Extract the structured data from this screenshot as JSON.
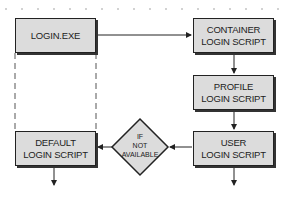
{
  "diagram": {
    "nodes": {
      "login_exe": {
        "line1": "LOGIN.EXE",
        "line2": ""
      },
      "container": {
        "line1": "CONTAINER",
        "line2": "LOGIN SCRIPT"
      },
      "profile": {
        "line1": "PROFILE",
        "line2": "LOGIN SCRIPT"
      },
      "user": {
        "line1": "USER",
        "line2": "LOGIN SCRIPT"
      },
      "default": {
        "line1": "DEFAULT",
        "line2": "LOGIN SCRIPT"
      }
    },
    "decision": {
      "line1": "IF",
      "line2": "NOT",
      "line3": "AVAILABLE"
    },
    "edges": [
      {
        "from": "login_exe",
        "to": "container",
        "style": "solid"
      },
      {
        "from": "container",
        "to": "profile",
        "style": "solid"
      },
      {
        "from": "profile",
        "to": "user",
        "style": "solid"
      },
      {
        "from": "user",
        "to": "decision",
        "style": "solid"
      },
      {
        "from": "decision",
        "to": "default",
        "style": "solid"
      },
      {
        "from": "login_exe",
        "to": "default",
        "style": "dashed"
      },
      {
        "from": "default",
        "to": "out",
        "style": "solid"
      },
      {
        "from": "user",
        "to": "out",
        "style": "solid"
      }
    ],
    "colors": {
      "box_fill": "#dcdcdc",
      "stroke": "#222222",
      "dots": "#999999"
    }
  }
}
